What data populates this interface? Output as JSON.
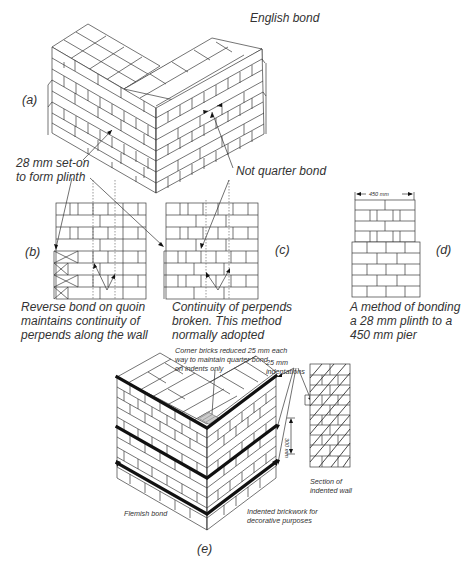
{
  "figure": {
    "title": "English bond",
    "panels": {
      "a": {
        "label": "(a)",
        "annotations": {
          "plinth": "28 mm set-on\nto form plinth",
          "not_quarter": "Not quarter bond"
        }
      },
      "b": {
        "label": "(b)",
        "caption": "Reverse bond on quoin\nmaintains continuity of\nperpends along the wall"
      },
      "c": {
        "label": "(c)",
        "caption": "Continuity of perpends\nbroken. This method\nnormally adopted"
      },
      "d": {
        "label": "(d)",
        "dimension": "450 mm",
        "caption": "A method of bonding\na 28 mm plinth to a\n450 mm pier"
      },
      "e": {
        "label": "(e)",
        "annotations": {
          "corner_bricks": "Corner bricks reduced 25 mm each\nway to maintain quarter bond\non indents only",
          "indentations": "25 mm\nindentations",
          "height": "300 mm",
          "section": "Section of\nindented wall",
          "flemish": "Flemish bond",
          "decorative": "Indented brickwork for\ndecorative purposes"
        }
      }
    }
  }
}
